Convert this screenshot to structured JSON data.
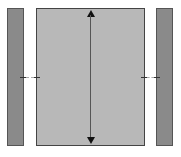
{
  "diagram": {
    "left_bar": {
      "color": "#8a8a8a"
    },
    "center_panel": {
      "color": "#b8b8b8"
    },
    "right_bar": {
      "color": "#8a8a8a"
    },
    "vertical_arrow": {
      "direction": "both"
    }
  }
}
